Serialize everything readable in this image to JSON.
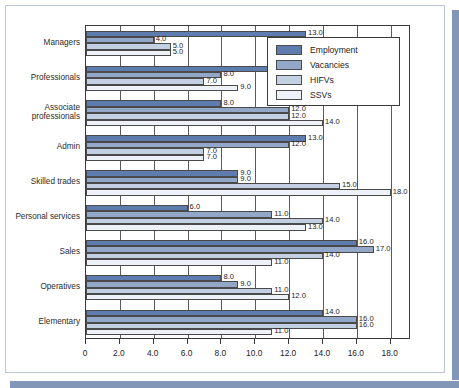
{
  "chart_data": {
    "type": "bar",
    "orientation": "horizontal",
    "title": "",
    "subtitle": "",
    "xlabel": "",
    "ylabel": "",
    "xlim": [
      0,
      19.2
    ],
    "xticks": [
      0,
      2,
      4,
      6,
      8,
      10,
      12,
      14,
      16,
      18
    ],
    "xtick_labels": [
      "0",
      "2.0",
      "4.0",
      "6.0",
      "8.0",
      "10.0",
      "12.0",
      "14.0",
      "16.0",
      "18.0"
    ],
    "grid": true,
    "grid_axis": "x",
    "legend_position": "top-right",
    "categories": [
      "Managers",
      "Professionals",
      "Associate professionals",
      "Admin",
      "Skilled trades",
      "Personal services",
      "Sales",
      "Operatives",
      "Elementary"
    ],
    "series": [
      {
        "name": "Employment",
        "color": "#5e7cad",
        "values": [
          13.0,
          14.0,
          8.0,
          13.0,
          9.0,
          6.0,
          16.0,
          8.0,
          14.0
        ],
        "labels": [
          "13.0",
          "14.0",
          "8.0",
          "13.0",
          "9.0",
          "6.0",
          "16.0",
          "8.0",
          "14.0"
        ]
      },
      {
        "name": "Vacancies",
        "color": "#93a8c8",
        "values": [
          4.0,
          8.0,
          12.0,
          12.0,
          9.0,
          11.0,
          17.0,
          9.0,
          16.0
        ],
        "labels": [
          "4.0",
          "8.0",
          "12.0",
          "12.0",
          "9.0",
          "11.0",
          "17.0",
          "9.0",
          "16.0"
        ]
      },
      {
        "name": "HIFVs",
        "color": "#c3d0e3",
        "values": [
          5.0,
          7.0,
          12.0,
          7.0,
          15.0,
          14.0,
          14.0,
          11.0,
          16.0
        ],
        "labels": [
          "5.0",
          "7.0",
          "12.0",
          "7.0",
          "15.0",
          "14.0",
          "14.0",
          "11.0",
          "16.0"
        ]
      },
      {
        "name": "SSVs",
        "color": "#eef2f8",
        "values": [
          5.0,
          9.0,
          14.0,
          7.0,
          18.0,
          13.0,
          11.0,
          12.0,
          11.0
        ],
        "labels": [
          "5.0",
          "9.0",
          "14.0",
          "7.0",
          "18.0",
          "13.0",
          "11.0",
          "12.0",
          "11.0"
        ]
      }
    ]
  },
  "legend": {
    "entries": [
      {
        "label": "Employment",
        "color": "#5e7cad"
      },
      {
        "label": "Vacancies",
        "color": "#93a8c8"
      },
      {
        "label": "HIFVs",
        "color": "#c3d0e3"
      },
      {
        "label": "SSVs",
        "color": "#eef2f8"
      }
    ]
  },
  "colors": {
    "series_employment": "#5e7cad",
    "series_vacancies": "#93a8c8",
    "series_hifvs": "#c3d0e3",
    "series_ssvs": "#eef2f8",
    "axis": "#3a3a3a",
    "grid": "#5a5a5a",
    "frame_border": "#b9c6da",
    "shadow": "#8296b8",
    "text": "#1d1d1d"
  }
}
